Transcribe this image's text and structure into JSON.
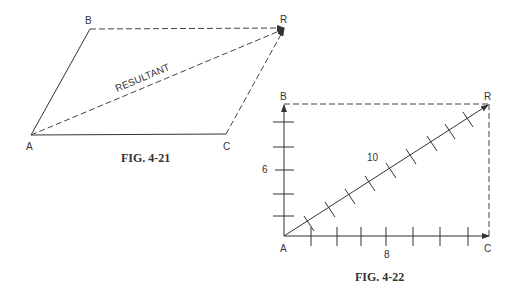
{
  "fig21": {
    "caption": "FIG. 4-21",
    "points": {
      "A": "A",
      "B": "B",
      "C": "C",
      "R": "R"
    },
    "resultant_label": "RESULTANT"
  },
  "fig22": {
    "caption": "FIG. 4-22",
    "points": {
      "A": "A",
      "B": "B",
      "C": "C",
      "R": "R"
    },
    "vertical_magnitude": "6",
    "horizontal_magnitude": "8",
    "resultant_magnitude": "10",
    "vertical_ticks": 5,
    "horizontal_ticks": 7,
    "diagonal_ticks": 9
  }
}
